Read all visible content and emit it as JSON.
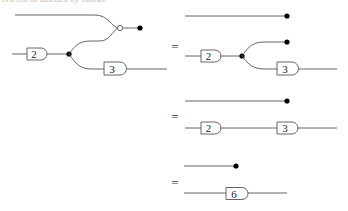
{
  "cutoff_text": "is a list of labelled by blocks",
  "equations": [
    {
      "label": "="
    },
    {
      "label": "="
    },
    {
      "label": "="
    }
  ],
  "diagrams": {
    "lhs": {
      "gates": [
        {
          "label": "2"
        },
        {
          "label": "3"
        }
      ],
      "description": "Input wire through gate 2 into a copy node; one branch merges with the top wire at a white merge node into a discard; the other branch goes through gate 3 to the output."
    },
    "step1": {
      "gates": [
        {
          "label": "2"
        },
        {
          "label": "3"
        }
      ],
      "description": "Top wire discarded; bottom wire through gate 2 into a copy node; one branch discarded, other through gate 3."
    },
    "step2": {
      "gates": [
        {
          "label": "2"
        },
        {
          "label": "3"
        }
      ],
      "description": "Top wire discarded; bottom wire through gates 2 then 3 in sequence."
    },
    "step3": {
      "gates": [
        {
          "label": "6"
        }
      ],
      "description": "Top wire discarded; bottom wire through a single gate 6."
    }
  },
  "colors": {
    "wire": "#555555",
    "dot": "#000000",
    "background": "#ffffff"
  }
}
